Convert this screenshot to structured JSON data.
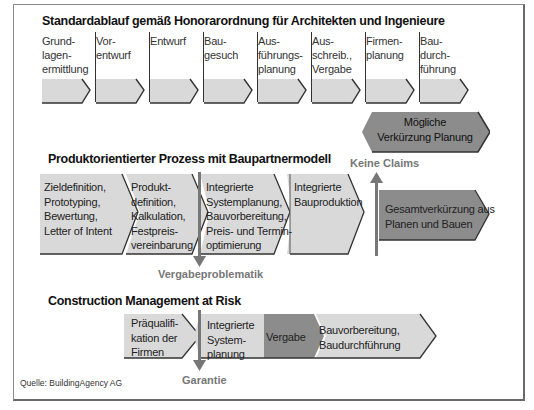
{
  "section1": {
    "title": "Standardablauf gemäß Honorarordnung für Architekten und Ingenieure",
    "phases": [
      {
        "lines": [
          "Grund-",
          "lagen-",
          "ermittlung"
        ]
      },
      {
        "lines": [
          "Vor-",
          "entwurf"
        ]
      },
      {
        "lines": [
          "Entwurf"
        ]
      },
      {
        "lines": [
          "Bau-",
          "gesuch"
        ]
      },
      {
        "lines": [
          "Aus-",
          "führungs-",
          "planung"
        ]
      },
      {
        "lines": [
          "Aus-",
          "schreib.,",
          "Vergabe"
        ]
      },
      {
        "lines": [
          "Firmen-",
          "planung"
        ]
      },
      {
        "lines": [
          "Bau-",
          "durch-",
          "führung"
        ]
      }
    ],
    "highlight": {
      "lines": [
        "Mögliche",
        "Verkürzung Planung"
      ]
    }
  },
  "section2": {
    "title": "Produktorientierter Prozess mit Baupartnermodell",
    "steps": [
      {
        "lines": [
          "Zieldefinition,",
          "Prototyping,",
          "Bewertung,",
          "Letter of Intent"
        ]
      },
      {
        "lines": [
          "Produkt-",
          "definition,",
          "Kalkulation,",
          "Festpreis-",
          "vereinbarung"
        ]
      },
      {
        "lines": [
          "Integrierte",
          "Systemplanung,",
          "Bauvorbereitung,",
          "Preis- und Termin-",
          "optimierung"
        ]
      },
      {
        "lines": [
          "Integrierte",
          "Bauproduktion"
        ]
      }
    ],
    "result": {
      "lines": [
        "Gesamtverkürzung aus",
        "Planen und Bauen"
      ]
    },
    "note_down": "Vergabeproblematik",
    "note_up": "Keine Claims"
  },
  "section3": {
    "title": "Construction Management at Risk",
    "steps": [
      {
        "lines": [
          "Präqualifi-",
          "kation der",
          "Firmen"
        ]
      },
      {
        "lines": [
          "Integrierte",
          "System-",
          "planung"
        ]
      },
      {
        "lines": [
          "Vergabe"
        ]
      },
      {
        "lines": [
          "Bauvorbereitung,",
          "Baudurchführung"
        ]
      }
    ],
    "note_down": "Garantie"
  },
  "source": "Quelle: BuildingAgency AG",
  "colors": {
    "light_fill": "#d9d9d9",
    "dark_fill": "#8c8c8c",
    "shadow": "#3a3a3a",
    "accent_line": "#777777"
  }
}
